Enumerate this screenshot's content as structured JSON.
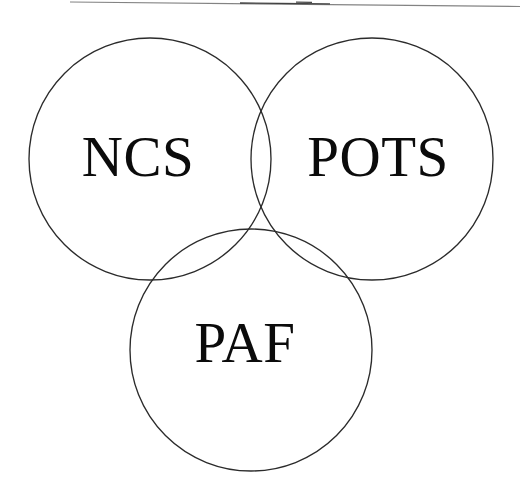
{
  "figure": {
    "background_color": "#ffffff",
    "stroke_color": "#2b2b2b",
    "label_color": "#0b0b0b",
    "width": 520,
    "height": 493
  },
  "diagram_data": {
    "type": "venn",
    "set_count": 3,
    "common_intersection_point": {
      "x": 252,
      "y": 232
    },
    "sets": [
      {
        "id": "ncs",
        "label": "NCS",
        "position": "top-left",
        "center": {
          "x": 150,
          "y": 159
        },
        "radius": 121,
        "label_anchor": {
          "x": 138,
          "y": 176
        }
      },
      {
        "id": "pots",
        "label": "POTS",
        "position": "top-right",
        "center": {
          "x": 372,
          "y": 159
        },
        "radius": 121,
        "label_anchor": {
          "x": 378,
          "y": 176
        }
      },
      {
        "id": "paf",
        "label": "PAF",
        "position": "bottom-center",
        "center": {
          "x": 251,
          "y": 350
        },
        "radius": 121,
        "label_anchor": {
          "x": 245,
          "y": 362
        }
      }
    ]
  },
  "artifacts": {
    "top_scan_line_label": "scan-edge-line"
  }
}
